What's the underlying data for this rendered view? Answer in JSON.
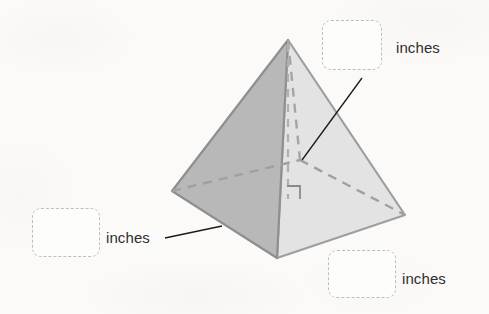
{
  "figure": {
    "shape_name": "square-pyramid",
    "faces": {
      "left_face_color": "#b8b8b8",
      "right_face_color": "#e3e3e3",
      "outline_color": "#8f8f8f",
      "hidden_edge_color": "#9a9a9a"
    },
    "leader_line_color": "#1a1a1a",
    "background_color": "#fbfaf9",
    "vertices": {
      "apex": [
        288,
        40
      ],
      "base_left": [
        172,
        191
      ],
      "base_front": [
        277,
        258
      ],
      "base_right": [
        405,
        215
      ],
      "base_back_hidden": [
        300,
        160
      ],
      "altitude_foot": [
        288,
        198
      ]
    },
    "right_angle_marker": {
      "present": true,
      "x": 288,
      "y": 186,
      "size": 12
    }
  },
  "answers": [
    {
      "id": "height",
      "value": "",
      "placeholder": "",
      "unit_label": "inches",
      "box": {
        "x": 322,
        "y": 20,
        "w": 60,
        "h": 50
      },
      "label_pos": {
        "x": 396,
        "y": 40
      },
      "leader": {
        "x1": 362,
        "y1": 78,
        "x2": 302,
        "y2": 160
      }
    },
    {
      "id": "slant-or-base-left",
      "value": "",
      "placeholder": "",
      "unit_label": "inches",
      "box": {
        "x": 32,
        "y": 208,
        "w": 68,
        "h": 49
      },
      "label_pos": {
        "x": 106,
        "y": 230
      },
      "leader": {
        "x1": 165,
        "y1": 238,
        "x2": 222,
        "y2": 226
      }
    },
    {
      "id": "base-edge",
      "value": "",
      "placeholder": "",
      "unit_label": "inches",
      "box": {
        "x": 328,
        "y": 250,
        "w": 68,
        "h": 48
      },
      "label_pos": {
        "x": 402,
        "y": 271
      },
      "leader": null
    }
  ]
}
